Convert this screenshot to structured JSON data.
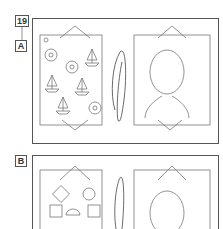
{
  "problem_number": "19",
  "options": [
    {
      "label": "A",
      "left_card_caption": "ペア 8",
      "left_card_tag": "絵あわせ",
      "bottom_note": "裏へ"
    },
    {
      "label": "B",
      "left_card_caption": "ペア 8",
      "left_card_tag": "絵あわせ"
    }
  ],
  "colors": {
    "line": "#555555",
    "light_line": "#999999",
    "background": "#ffffff"
  }
}
